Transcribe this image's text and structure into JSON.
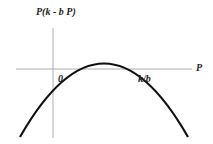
{
  "diagram": {
    "type": "parabola-graph",
    "y_axis_label": "P(k - b P)",
    "x_axis_label": "P",
    "x_intercepts": [
      "0",
      "k/b"
    ],
    "curve": "downward-opening parabola through 0 and k/b",
    "colors": {
      "curve": "#111111",
      "axes": "#999999",
      "text": "#222222"
    }
  }
}
